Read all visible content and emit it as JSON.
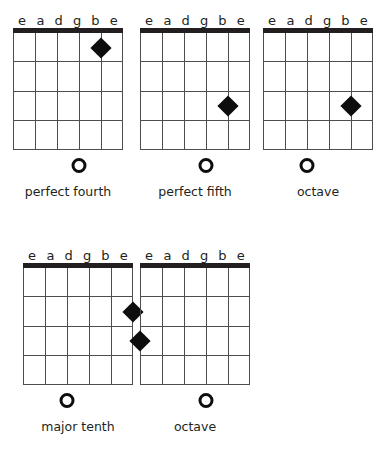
{
  "figure": {
    "strings": [
      "e",
      "a",
      "d",
      "g",
      "b",
      "e"
    ],
    "fret_count": 4,
    "marker_icon": "filled-diamond-icon",
    "open_string_icon": "open-circle-icon",
    "colors": {
      "background": "#ffffff",
      "ink": "#231f20",
      "grid_line": "#4d4d4f",
      "marker": "#0d0d0d"
    }
  },
  "diagrams": [
    {
      "id": "perfect-fourth",
      "caption": "perfect fourth",
      "string_labels": [
        "e",
        "a",
        "d",
        "g",
        "b",
        "e"
      ],
      "markers": [
        {
          "string": 5,
          "string_label": "b",
          "fret": 1
        }
      ],
      "open_strings": [
        {
          "string": 4,
          "string_label": "g"
        }
      ],
      "position": {
        "left": 8,
        "top": 10
      }
    },
    {
      "id": "perfect-fifth",
      "caption": "perfect fifth",
      "string_labels": [
        "e",
        "a",
        "d",
        "g",
        "b",
        "e"
      ],
      "markers": [
        {
          "string": 5,
          "string_label": "b",
          "fret": 3
        }
      ],
      "open_strings": [
        {
          "string": 4,
          "string_label": "g"
        }
      ],
      "position": {
        "left": 135,
        "top": 10
      }
    },
    {
      "id": "octave-upper",
      "caption": "octave",
      "string_labels": [
        "e",
        "a",
        "d",
        "g",
        "b",
        "e"
      ],
      "markers": [
        {
          "string": 5,
          "string_label": "b",
          "fret": 3
        }
      ],
      "open_strings": [
        {
          "string": 3,
          "string_label": "d"
        }
      ],
      "position": {
        "left": 258,
        "top": 10
      }
    },
    {
      "id": "major-tenth",
      "caption": "major tenth",
      "string_labels": [
        "e",
        "a",
        "d",
        "g",
        "b",
        "e"
      ],
      "markers": [
        {
          "string": 6,
          "string_label": "e",
          "fret": 2
        }
      ],
      "open_strings": [
        {
          "string": 3,
          "string_label": "d"
        }
      ],
      "position": {
        "left": 18,
        "top": 245
      }
    },
    {
      "id": "octave-lower",
      "caption": "octave",
      "string_labels": [
        "e",
        "a",
        "d",
        "g",
        "b",
        "e"
      ],
      "markers": [
        {
          "string": 1,
          "string_label": "e",
          "fret": 3
        }
      ],
      "open_strings": [
        {
          "string": 4,
          "string_label": "g"
        }
      ],
      "position": {
        "left": 135,
        "top": 245
      }
    }
  ]
}
